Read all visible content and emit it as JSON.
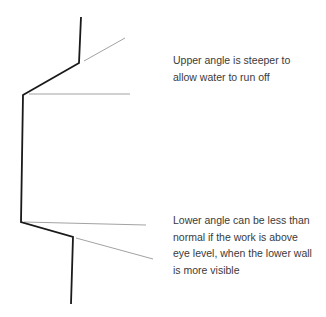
{
  "diagram": {
    "upper_note": "Upper angle is steeper to allow water to run off",
    "upper_note_lines": [
      "Upper angle is steeper to",
      "allow water to run off"
    ],
    "lower_note": "Lower angle can be less than normal if the work is above eye level, when the lower wall is more visible",
    "lower_note_lines": [
      "Lower angle can be less than",
      "normal if the work is above",
      "eye level, when the lower wall",
      "is more visible"
    ],
    "colors": {
      "profile": "#1a1a1a",
      "guide": "#8a8a8a",
      "text": "#3a3a3a"
    }
  }
}
